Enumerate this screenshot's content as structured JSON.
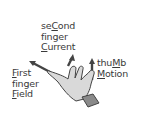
{
  "diagram": {
    "second_finger": {
      "line1_pre": "se",
      "line1_u": "C",
      "line1_post": "ond",
      "line2": "finger",
      "line3_u": "C",
      "line3_post": "urrent"
    },
    "first_finger": {
      "line1_u": "F",
      "line1_post": "irst",
      "line2": "finger",
      "line3_u": "F",
      "line3_post": "ield"
    },
    "thumb": {
      "line1_pre": "thu",
      "line1_u": "M",
      "line1_post": "b",
      "line2_u": "M",
      "line2_post": "otion"
    },
    "colors": {
      "text": "#3a3a3a",
      "hand": "#d9d9d9",
      "hand_outline": "#444444",
      "cuff": "#8a8a8a",
      "arrow": "#444444"
    }
  }
}
